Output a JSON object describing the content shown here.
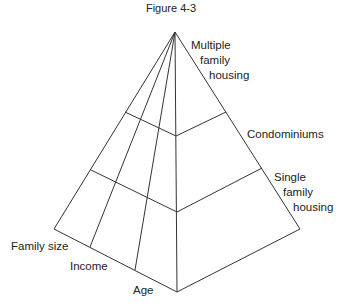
{
  "title": "Figure 4-3",
  "levels": [
    {
      "label_lines": [
        "Multiple",
        "family",
        "housing"
      ]
    },
    {
      "label_lines": [
        "Condominiums"
      ]
    },
    {
      "label_lines": [
        "Single",
        "family",
        "housing"
      ]
    }
  ],
  "dimensions": [
    "Family size",
    "Income",
    "Age"
  ],
  "colors": {
    "line": "#333333",
    "text": "#222222"
  }
}
